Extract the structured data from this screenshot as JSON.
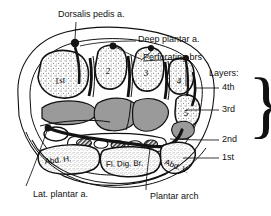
{
  "figure": {
    "colors": {
      "ink": "#111111",
      "muscle_fill": "#9a9a9a",
      "bone_fill": "#ffffff",
      "skin_fill": "#ffffff",
      "vessel_fill": "#1a1a1a",
      "background": "#ffffff"
    }
  },
  "callouts": {
    "dorsalis_pedis": "Dorsalis pedis a.",
    "deep_plantar": "Deep plantar a.",
    "perforating": "Perforating brs",
    "lat_plantar": "Lat. plantar a.",
    "plantar_arch": "Plantar arch"
  },
  "layers": {
    "heading": "Layers:",
    "items": [
      {
        "label": "4th"
      },
      {
        "label": "3rd"
      },
      {
        "label": "2nd"
      },
      {
        "label": "1st"
      }
    ],
    "brace": "}"
  },
  "metatarsals": [
    {
      "label": "1st"
    },
    {
      "label": "2"
    },
    {
      "label": "3"
    },
    {
      "label": "4"
    },
    {
      "label": "5"
    }
  ],
  "muscles": [
    {
      "label": "Abd. H."
    },
    {
      "label": "Fl. Dig. Br."
    },
    {
      "label": "Abd. V."
    }
  ]
}
